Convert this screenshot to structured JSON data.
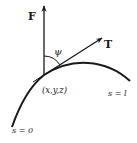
{
  "figure": {
    "labels": {
      "force": "F",
      "tangent": "T",
      "angle": "ψ",
      "point": "(x,y,z)",
      "end": "s = l",
      "start": "s = 0"
    },
    "colors": {
      "ink": "#1a1a1a",
      "background": "#ffffff"
    }
  }
}
